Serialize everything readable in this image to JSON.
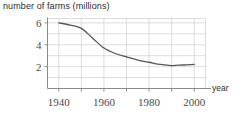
{
  "chart_data": {
    "type": "line",
    "title": "number of farms (millions)",
    "xlabel": "year",
    "ylabel": "",
    "xlim": [
      1935,
      2005
    ],
    "ylim": [
      0,
      6.4
    ],
    "grid": true,
    "legend": null,
    "x_ticks": [
      1940,
      1960,
      1980,
      2000
    ],
    "x_tick_labels": [
      "1940",
      "1960",
      "1980",
      "2000"
    ],
    "x_gridlines": [
      1940,
      1950,
      1960,
      1970,
      1980,
      1990,
      2000
    ],
    "y_ticks": [
      2,
      4,
      6
    ],
    "y_tick_labels": [
      "2",
      "4",
      "6"
    ],
    "y_gridlines": [
      1,
      2,
      3,
      4,
      5,
      6
    ],
    "series": [
      {
        "name": "number of farms",
        "units": "millions",
        "x": [
          1940,
          1945,
          1950,
          1955,
          1960,
          1965,
          1970,
          1975,
          1980,
          1985,
          1990,
          1995,
          2000
        ],
        "values": [
          6.0,
          5.8,
          5.5,
          4.6,
          3.7,
          3.2,
          2.9,
          2.6,
          2.4,
          2.2,
          2.1,
          2.15,
          2.2
        ]
      }
    ],
    "line_color": "#555555",
    "grid_color": "#cfcfcf",
    "axis_color": "#8a8a8a"
  },
  "axis_labels": {
    "x_name": "year"
  }
}
